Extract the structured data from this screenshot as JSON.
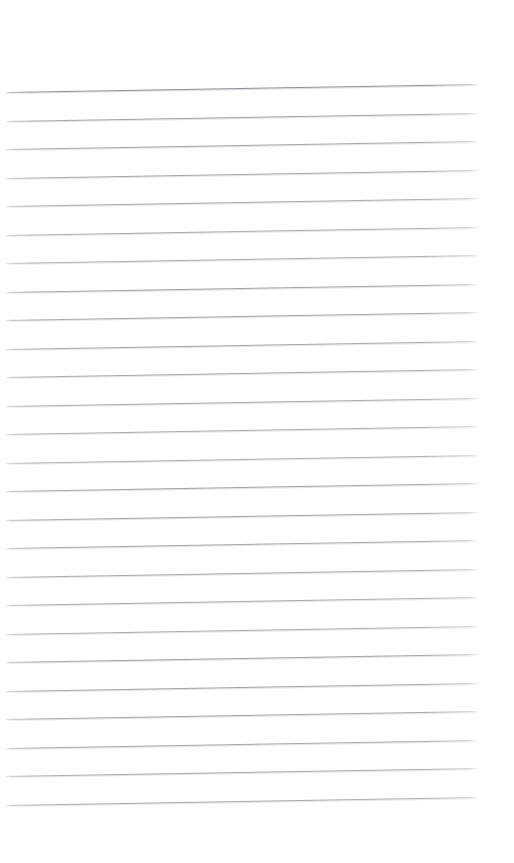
{
  "document": {
    "kind": "scanned-ruled-notebook-page",
    "title": "Blank lined notebook page",
    "page_width": 514,
    "page_height": 863,
    "background_color": "#ffffff",
    "text_content": "",
    "handwriting_present": false,
    "printed_text_present": false
  },
  "ruling": {
    "line_color": "#96989e",
    "heavy_line_color": "#7a7d85",
    "line_count": 26,
    "first_line_y": 92,
    "last_line_y": 805,
    "line_spacing_px": 28.5,
    "line_start_x": 5,
    "line_end_x": 480,
    "line_thickness_px": 1,
    "skew_degrees": -0.95,
    "heavy_line_indices": [
      0
    ],
    "lines_y": [
      92,
      120.5,
      149,
      177.5,
      206,
      234.5,
      263,
      291.5,
      320,
      348.5,
      377,
      405.5,
      434,
      462.5,
      491,
      519.5,
      548,
      576.5,
      605,
      633.5,
      662,
      690.5,
      719,
      747.5,
      776,
      804.5
    ]
  },
  "margins": {
    "top_blank_px": 86,
    "bottom_blank_px": 58,
    "left_blank_px": 5,
    "right_blank_px": 34,
    "margin_rule_present": false
  }
}
